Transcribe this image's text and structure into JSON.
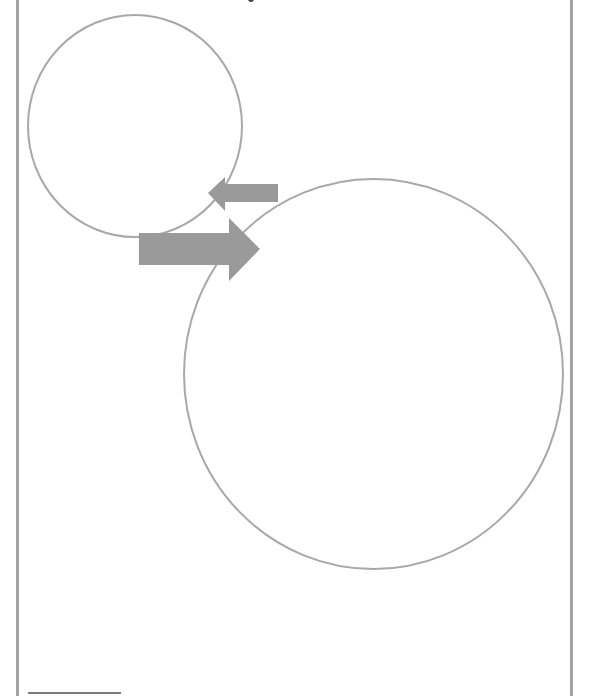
{
  "page": {
    "type": "scanned-document-figure",
    "width": 589,
    "height": 696
  },
  "colors": {
    "frame": "#a3a3a3",
    "circle_stroke": "#a8a8a8",
    "arrow_fill": "#9a9a9a",
    "footnote_rule": "#7a7a7a",
    "background": "#ffffff"
  },
  "diagram": {
    "shapes": [
      {
        "id": "small-circle",
        "kind": "ellipse",
        "cx": 135,
        "cy": 126,
        "rx": 107,
        "ry": 111,
        "fill": "none"
      },
      {
        "id": "large-circle",
        "kind": "ellipse",
        "cx": 373.5,
        "cy": 374,
        "rx": 189.5,
        "ry": 195,
        "fill": "none"
      }
    ],
    "arrows": [
      {
        "id": "arrow-from-large-to-small",
        "direction": "left",
        "points": "278,184 225,184 225,177 208,193 225,211 225,202 278,202"
      },
      {
        "id": "arrow-from-small-to-large",
        "direction": "right",
        "points": "139,233 229,233 229,218 260,249 229,281 229,265 139,265"
      }
    ]
  }
}
